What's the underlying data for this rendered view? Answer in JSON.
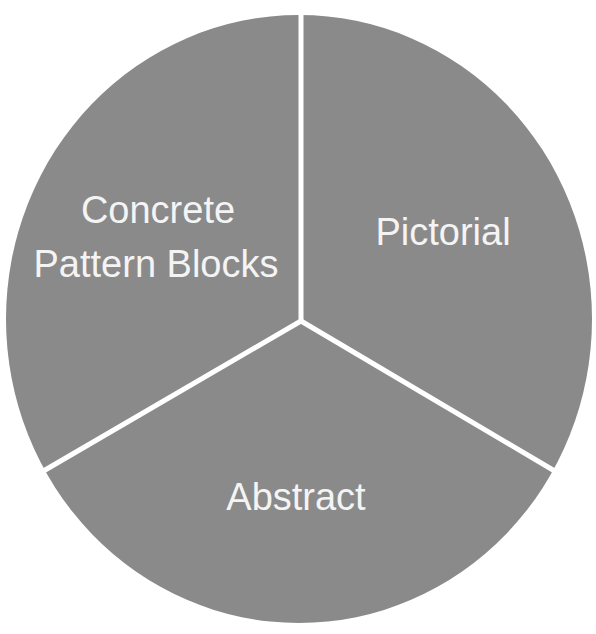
{
  "diagram": {
    "type": "pie-cycle",
    "fill_color": "#8a8a8a",
    "divider_color": "#ffffff",
    "text_color": "#f4f4f4",
    "segments": [
      {
        "id": "concrete",
        "line1": "Concrete",
        "line2": "Pattern Blocks"
      },
      {
        "id": "pictorial",
        "line1": "Pictorial"
      },
      {
        "id": "abstract",
        "line1": "Abstract"
      }
    ]
  }
}
